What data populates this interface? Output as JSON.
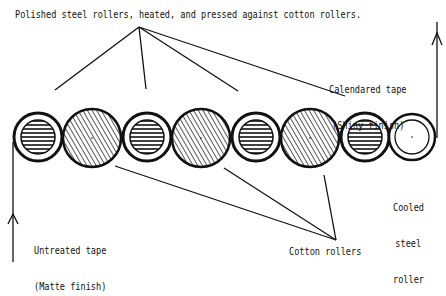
{
  "diagram": {
    "title_label": "Polished steel rollers, heated, and pressed against cotton rollers.",
    "output_label": {
      "line1": "Calendared tape",
      "line2": "(Shiny finish)"
    },
    "input_label": {
      "line1": "Untreated tape",
      "line2": "(Matte finish)"
    },
    "cooled_roller_label": {
      "line1": "Cooled",
      "line2": "steel",
      "line3": "roller"
    },
    "cotton_rollers_label": "Cotton rollers",
    "rollers": [
      {
        "type": "steel-heated",
        "cx": 38,
        "cy": 137,
        "r": 24
      },
      {
        "type": "cotton",
        "cx": 92,
        "cy": 138,
        "r": 29
      },
      {
        "type": "steel-heated",
        "cx": 147,
        "cy": 137,
        "r": 24
      },
      {
        "type": "cotton",
        "cx": 201,
        "cy": 138,
        "r": 29
      },
      {
        "type": "steel-heated",
        "cx": 256,
        "cy": 137,
        "r": 24
      },
      {
        "type": "cotton",
        "cx": 310,
        "cy": 138,
        "r": 29
      },
      {
        "type": "steel-heated",
        "cx": 365,
        "cy": 137,
        "r": 24
      },
      {
        "type": "steel-cooled",
        "cx": 412,
        "cy": 137,
        "r": 23
      }
    ],
    "colors": {
      "ink": "#111111",
      "background": "#ffffff"
    }
  }
}
